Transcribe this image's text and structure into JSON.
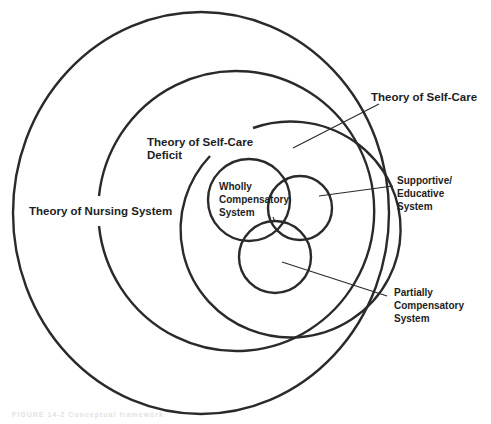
{
  "diagram": {
    "labels": {
      "nursing_system": "Theory of Nursing System",
      "self_care_deficit": "Theory of Self-Care\nDeficit",
      "self_care": "Theory of Self-Care",
      "wholly_compensatory": "Wholly\nCompensatory\nSystem",
      "supportive_educative": "Supportive/\nEducative\nSystem",
      "partially_compensatory": "Partially\nCompensatory\nSystem"
    },
    "colors": {
      "stroke": "#2a2a2a",
      "text": "#1e1e1e",
      "background": "#ffffff"
    },
    "shapes": {
      "outer_circle": {
        "cx": 201,
        "cy": 213,
        "rx": 189,
        "ry": 202,
        "represents": "Theory of Nursing System"
      },
      "middle_circle": {
        "cx": 232,
        "cy": 211,
        "r": 138,
        "gap": "left",
        "represents": "Theory of Self-Care Deficit"
      },
      "inner_circle": {
        "cx": 247,
        "cy": 238,
        "r": 107,
        "gap": "upper-left",
        "represents": "Theory of Self-Care"
      },
      "wholly_circle": {
        "cx": 248,
        "cy": 200,
        "r": 42
      },
      "supportive_circle": {
        "cx": 299,
        "cy": 207,
        "r": 32
      },
      "partially_circle": {
        "cx": 275,
        "cy": 257,
        "r": 36
      }
    }
  },
  "caption": "FIGURE 14-2  Conceptual framework"
}
